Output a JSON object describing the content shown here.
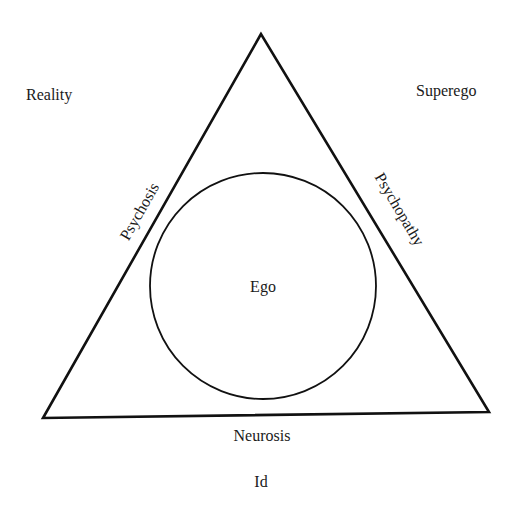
{
  "diagram": {
    "corners": {
      "top_left": "Reality",
      "top_right": "Superego",
      "bottom": "Id"
    },
    "sides": {
      "left": "Psychosis",
      "right": "Psychopathy",
      "bottom": "Neurosis"
    },
    "center": "Ego",
    "colors": {
      "stroke": "#111111",
      "text": "#1a1a1a",
      "background": "#ffffff"
    }
  }
}
